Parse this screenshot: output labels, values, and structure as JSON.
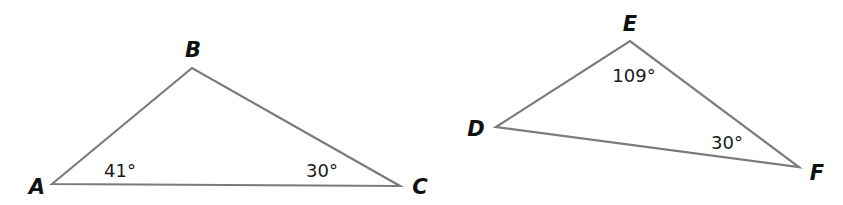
{
  "colors": {
    "background": "#ffffff",
    "line": "#7b7b7b",
    "vertex_text": "#111111",
    "angle_text": "#1a1a1a"
  },
  "triangles": [
    {
      "name": "ABC",
      "vertices": [
        {
          "label": "A",
          "x": 52,
          "y": 184,
          "label_x": 37,
          "label_y": 194
        },
        {
          "label": "B",
          "x": 192,
          "y": 68,
          "label_x": 193,
          "label_y": 57
        },
        {
          "label": "C",
          "x": 400,
          "y": 186,
          "label_x": 420,
          "label_y": 194
        }
      ],
      "angles": [
        {
          "at": "A",
          "text": "41°",
          "x": 120,
          "y": 177
        },
        {
          "at": "C",
          "text": "30°",
          "x": 322,
          "y": 177
        }
      ]
    },
    {
      "name": "DEF",
      "vertices": [
        {
          "label": "D",
          "x": 496,
          "y": 127,
          "label_x": 476,
          "label_y": 136
        },
        {
          "label": "E",
          "x": 630,
          "y": 41,
          "label_x": 630,
          "label_y": 31
        },
        {
          "label": "F",
          "x": 799,
          "y": 167,
          "label_x": 817,
          "label_y": 180
        }
      ],
      "angles": [
        {
          "at": "E",
          "text": "109°",
          "x": 634,
          "y": 82
        },
        {
          "at": "F",
          "text": "30°",
          "x": 727,
          "y": 149
        }
      ]
    }
  ],
  "labels": {
    "A": "A",
    "B": "B",
    "C": "C",
    "D": "D",
    "E": "E",
    "F": "F",
    "angle_A": "41°",
    "angle_C": "30°",
    "angle_E": "109°",
    "angle_F": "30°"
  }
}
